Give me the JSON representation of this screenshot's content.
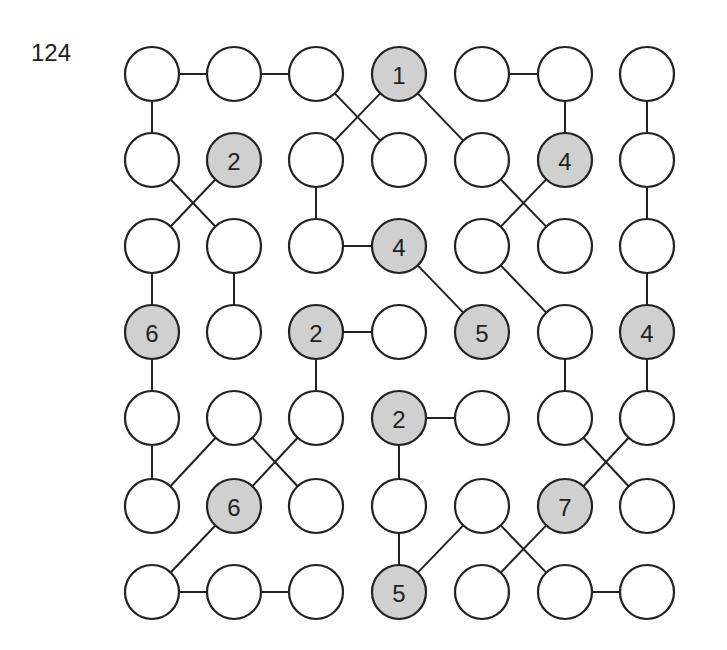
{
  "puzzle": {
    "number": "124",
    "grid": {
      "rows": 7,
      "cols": 7
    },
    "colors": {
      "clue_fill": "#d0d0d0",
      "empty_fill": "#ffffff",
      "stroke": "#222222"
    },
    "layout": {
      "col_x": [
        152,
        234,
        316,
        399,
        482,
        565,
        647
      ],
      "row_y": [
        74,
        160,
        246,
        332,
        418,
        506,
        592
      ],
      "radius": 27
    },
    "clues": [
      {
        "r": 0,
        "c": 3,
        "value": "1"
      },
      {
        "r": 1,
        "c": 1,
        "value": "2"
      },
      {
        "r": 1,
        "c": 5,
        "value": "4"
      },
      {
        "r": 2,
        "c": 3,
        "value": "4"
      },
      {
        "r": 3,
        "c": 0,
        "value": "6"
      },
      {
        "r": 3,
        "c": 2,
        "value": "2"
      },
      {
        "r": 3,
        "c": 4,
        "value": "5"
      },
      {
        "r": 3,
        "c": 6,
        "value": "4"
      },
      {
        "r": 4,
        "c": 3,
        "value": "2"
      },
      {
        "r": 5,
        "c": 1,
        "value": "6"
      },
      {
        "r": 5,
        "c": 5,
        "value": "7"
      },
      {
        "r": 6,
        "c": 3,
        "value": "5"
      }
    ],
    "connections": [
      [
        [
          0,
          0
        ],
        [
          0,
          1
        ]
      ],
      [
        [
          0,
          1
        ],
        [
          0,
          2
        ]
      ],
      [
        [
          0,
          0
        ],
        [
          1,
          0
        ]
      ],
      [
        [
          0,
          2
        ],
        [
          1,
          3
        ]
      ],
      [
        [
          0,
          3
        ],
        [
          1,
          2
        ]
      ],
      [
        [
          0,
          3
        ],
        [
          1,
          4
        ]
      ],
      [
        [
          0,
          4
        ],
        [
          0,
          5
        ]
      ],
      [
        [
          0,
          5
        ],
        [
          1,
          5
        ]
      ],
      [
        [
          0,
          6
        ],
        [
          1,
          6
        ]
      ],
      [
        [
          1,
          0
        ],
        [
          2,
          1
        ]
      ],
      [
        [
          1,
          1
        ],
        [
          2,
          0
        ]
      ],
      [
        [
          1,
          2
        ],
        [
          2,
          2
        ]
      ],
      [
        [
          1,
          4
        ],
        [
          2,
          5
        ]
      ],
      [
        [
          1,
          5
        ],
        [
          2,
          4
        ]
      ],
      [
        [
          1,
          6
        ],
        [
          2,
          6
        ]
      ],
      [
        [
          2,
          0
        ],
        [
          3,
          0
        ]
      ],
      [
        [
          2,
          1
        ],
        [
          3,
          1
        ]
      ],
      [
        [
          2,
          2
        ],
        [
          2,
          3
        ]
      ],
      [
        [
          2,
          3
        ],
        [
          3,
          4
        ]
      ],
      [
        [
          2,
          4
        ],
        [
          3,
          5
        ]
      ],
      [
        [
          2,
          6
        ],
        [
          3,
          6
        ]
      ],
      [
        [
          3,
          0
        ],
        [
          4,
          0
        ]
      ],
      [
        [
          3,
          2
        ],
        [
          3,
          3
        ]
      ],
      [
        [
          3,
          2
        ],
        [
          4,
          2
        ]
      ],
      [
        [
          3,
          5
        ],
        [
          4,
          5
        ]
      ],
      [
        [
          3,
          6
        ],
        [
          4,
          6
        ]
      ],
      [
        [
          4,
          0
        ],
        [
          5,
          0
        ]
      ],
      [
        [
          4,
          1
        ],
        [
          5,
          0
        ]
      ],
      [
        [
          4,
          1
        ],
        [
          5,
          2
        ]
      ],
      [
        [
          4,
          2
        ],
        [
          5,
          1
        ]
      ],
      [
        [
          4,
          3
        ],
        [
          4,
          4
        ]
      ],
      [
        [
          4,
          3
        ],
        [
          5,
          3
        ]
      ],
      [
        [
          4,
          5
        ],
        [
          5,
          6
        ]
      ],
      [
        [
          4,
          6
        ],
        [
          5,
          5
        ]
      ],
      [
        [
          5,
          1
        ],
        [
          6,
          0
        ]
      ],
      [
        [
          5,
          3
        ],
        [
          6,
          3
        ]
      ],
      [
        [
          5,
          4
        ],
        [
          6,
          3
        ]
      ],
      [
        [
          5,
          4
        ],
        [
          6,
          5
        ]
      ],
      [
        [
          5,
          5
        ],
        [
          6,
          4
        ]
      ],
      [
        [
          6,
          0
        ],
        [
          6,
          1
        ]
      ],
      [
        [
          6,
          1
        ],
        [
          6,
          2
        ]
      ],
      [
        [
          6,
          5
        ],
        [
          6,
          6
        ]
      ]
    ]
  }
}
